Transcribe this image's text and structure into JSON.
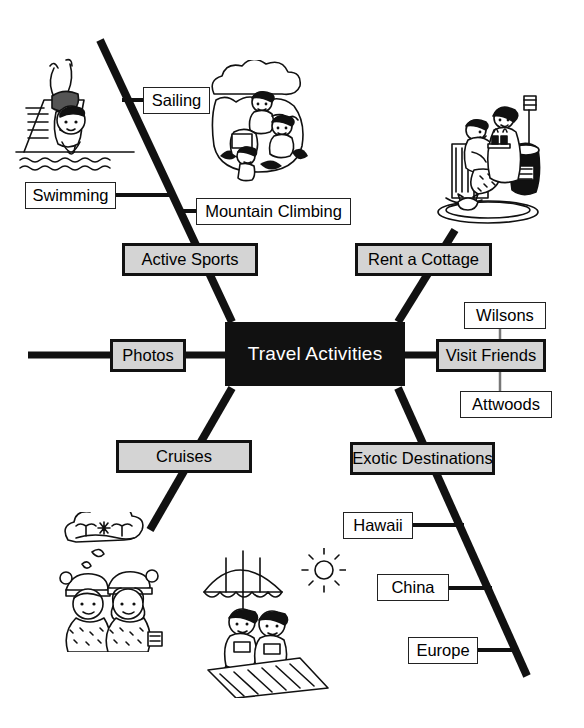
{
  "diagram": {
    "kind": "fishbone-mind-map",
    "center": {
      "label": "Travel Activities",
      "bg_color": "#111111",
      "text_color": "#ffffff"
    },
    "category_style": {
      "bg_color": "#d4d4d4",
      "border_color": "#111111",
      "text_color": "#000000"
    },
    "leaf_style": {
      "bg_color": "#ffffff",
      "border_color": "#222222",
      "text_color": "#000000"
    },
    "branches": [
      {
        "id": "active-sports",
        "label": "Active Sports",
        "position": "upper-left",
        "leaves": [
          {
            "id": "sailing",
            "label": "Sailing"
          },
          {
            "id": "swimming",
            "label": "Swimming"
          },
          {
            "id": "mountain-climbing",
            "label": "Mountain Climbing"
          }
        ]
      },
      {
        "id": "rent-a-cottage",
        "label": "Rent a Cottage",
        "position": "upper-right",
        "leaves": []
      },
      {
        "id": "photos",
        "label": "Photos",
        "position": "left-spine",
        "leaves": []
      },
      {
        "id": "visit-friends",
        "label": "Visit Friends",
        "position": "right-spine",
        "leaves": [
          {
            "id": "wilsons",
            "label": "Wilsons"
          },
          {
            "id": "attwoods",
            "label": "Attwoods"
          }
        ]
      },
      {
        "id": "cruises",
        "label": "Cruises",
        "position": "lower-left",
        "leaves": []
      },
      {
        "id": "exotic-destinations",
        "label": "Exotic Destinations",
        "position": "lower-right",
        "leaves": [
          {
            "id": "hawaii",
            "label": "Hawaii"
          },
          {
            "id": "china",
            "label": "China"
          },
          {
            "id": "europe",
            "label": "Europe"
          }
        ]
      }
    ],
    "illustrations": [
      {
        "id": "swimmer-diving-art",
        "name": "swimmer-diving-illustration",
        "branch": "active-sports"
      },
      {
        "id": "mountain-climbers-art",
        "name": "mountain-climbers-illustration",
        "branch": "active-sports"
      },
      {
        "id": "cottage-fireplace-art",
        "name": "couple-by-fireplace-illustration",
        "branch": "rent-a-cottage"
      },
      {
        "id": "winter-daydream-art",
        "name": "couple-daydreaming-of-tropics-illustration",
        "branch": "cruises"
      },
      {
        "id": "beach-sunbathers-art",
        "name": "sunbathers-under-umbrella-illustration",
        "branch": "exotic-destinations"
      }
    ]
  }
}
